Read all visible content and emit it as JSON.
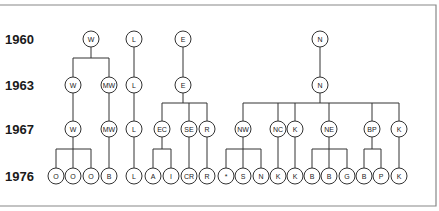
{
  "years": [
    {
      "id": "y1960",
      "label": "1960"
    },
    {
      "id": "y1963",
      "label": "1963"
    },
    {
      "id": "y1967",
      "label": "1967"
    },
    {
      "id": "y1976",
      "label": "1976"
    }
  ],
  "nodes": [
    {
      "id": "w60",
      "label": "W",
      "year": "y1960",
      "col": 91
    },
    {
      "id": "l60",
      "label": "L",
      "year": "y1960",
      "col": 134
    },
    {
      "id": "e60",
      "label": "E",
      "year": "y1960",
      "col": 183
    },
    {
      "id": "n60",
      "label": "N",
      "year": "y1960",
      "col": 320
    },
    {
      "id": "w63",
      "label": "W",
      "year": "y1963",
      "col": 73
    },
    {
      "id": "mw63",
      "label": "MW",
      "year": "y1963",
      "col": 109
    },
    {
      "id": "l63",
      "label": "L",
      "year": "y1963",
      "col": 134
    },
    {
      "id": "e63",
      "label": "E",
      "year": "y1963",
      "col": 183
    },
    {
      "id": "n63",
      "label": "N",
      "year": "y1963",
      "col": 320
    },
    {
      "id": "w67",
      "label": "W",
      "year": "y1967",
      "col": 73
    },
    {
      "id": "mw67",
      "label": "MW",
      "year": "y1967",
      "col": 109
    },
    {
      "id": "l67",
      "label": "L",
      "year": "y1967",
      "col": 134
    },
    {
      "id": "ec67",
      "label": "EC",
      "year": "y1967",
      "col": 162
    },
    {
      "id": "se67",
      "label": "SE",
      "year": "y1967",
      "col": 189
    },
    {
      "id": "r67",
      "label": "R",
      "year": "y1967",
      "col": 207
    },
    {
      "id": "nw67",
      "label": "NW",
      "year": "y1967",
      "col": 243
    },
    {
      "id": "nc67",
      "label": "NC",
      "year": "y1967",
      "col": 278
    },
    {
      "id": "k67a",
      "label": "K",
      "year": "y1967",
      "col": 295
    },
    {
      "id": "ne67",
      "label": "NE",
      "year": "y1967",
      "col": 329
    },
    {
      "id": "bp67",
      "label": "BP",
      "year": "y1967",
      "col": 372
    },
    {
      "id": "k67b",
      "label": "K",
      "year": "y1967",
      "col": 399
    },
    {
      "id": "o76a",
      "label": "O",
      "year": "y1976",
      "col": 56
    },
    {
      "id": "o76b",
      "label": "O",
      "year": "y1976",
      "col": 73
    },
    {
      "id": "o76c",
      "label": "O",
      "year": "y1976",
      "col": 91
    },
    {
      "id": "b76a",
      "label": "B",
      "year": "y1976",
      "col": 109
    },
    {
      "id": "l76",
      "label": "L",
      "year": "y1976",
      "col": 134
    },
    {
      "id": "a76",
      "label": "A",
      "year": "y1976",
      "col": 153
    },
    {
      "id": "i76",
      "label": "I",
      "year": "y1976",
      "col": 171
    },
    {
      "id": "cr76",
      "label": "CR",
      "year": "y1976",
      "col": 189
    },
    {
      "id": "r76",
      "label": "R",
      "year": "y1976",
      "col": 207
    },
    {
      "id": "star76",
      "label": "*",
      "year": "y1976",
      "col": 226
    },
    {
      "id": "s76",
      "label": "S",
      "year": "y1976",
      "col": 243
    },
    {
      "id": "n76",
      "label": "N",
      "year": "y1976",
      "col": 261
    },
    {
      "id": "k76a",
      "label": "K",
      "year": "y1976",
      "col": 278
    },
    {
      "id": "k76b",
      "label": "K",
      "year": "y1976",
      "col": 295
    },
    {
      "id": "b76b",
      "label": "B",
      "year": "y1976",
      "col": 312
    },
    {
      "id": "b76c",
      "label": "B",
      "year": "y1976",
      "col": 329
    },
    {
      "id": "g76",
      "label": "G",
      "year": "y1976",
      "col": 347
    },
    {
      "id": "b76d",
      "label": "B",
      "year": "y1976",
      "col": 364
    },
    {
      "id": "p76",
      "label": "P",
      "year": "y1976",
      "col": 381
    },
    {
      "id": "k76c",
      "label": "K",
      "year": "y1976",
      "col": 399
    }
  ],
  "edges": [
    {
      "parent": "w60",
      "children": [
        "w63",
        "mw63"
      ]
    },
    {
      "parent": "l60",
      "children": [
        "l63"
      ]
    },
    {
      "parent": "e60",
      "children": [
        "e63"
      ]
    },
    {
      "parent": "n60",
      "children": [
        "n63"
      ]
    },
    {
      "parent": "w63",
      "children": [
        "w67"
      ]
    },
    {
      "parent": "mw63",
      "children": [
        "mw67"
      ]
    },
    {
      "parent": "l63",
      "children": [
        "l67"
      ]
    },
    {
      "parent": "e63",
      "children": [
        "ec67",
        "se67",
        "r67"
      ]
    },
    {
      "parent": "n63",
      "children": [
        "nw67",
        "nc67",
        "k67a",
        "ne67",
        "bp67",
        "k67b"
      ]
    },
    {
      "parent": "w67",
      "children": [
        "o76a",
        "o76b",
        "o76c"
      ]
    },
    {
      "parent": "mw67",
      "children": [
        "b76a"
      ]
    },
    {
      "parent": "l67",
      "children": [
        "l76"
      ]
    },
    {
      "parent": "ec67",
      "children": [
        "a76",
        "i76"
      ]
    },
    {
      "parent": "se67",
      "children": [
        "cr76"
      ]
    },
    {
      "parent": "r67",
      "children": [
        "r76"
      ]
    },
    {
      "parent": "nw67",
      "children": [
        "star76",
        "s76",
        "n76"
      ]
    },
    {
      "parent": "nc67",
      "children": [
        "k76a"
      ]
    },
    {
      "parent": "k67a",
      "children": [
        "k76b"
      ]
    },
    {
      "parent": "ne67",
      "children": [
        "b76b",
        "b76c",
        "g76"
      ]
    },
    {
      "parent": "bp67",
      "children": [
        "b76d",
        "p76"
      ]
    },
    {
      "parent": "k67b",
      "children": [
        "k76c"
      ]
    }
  ]
}
